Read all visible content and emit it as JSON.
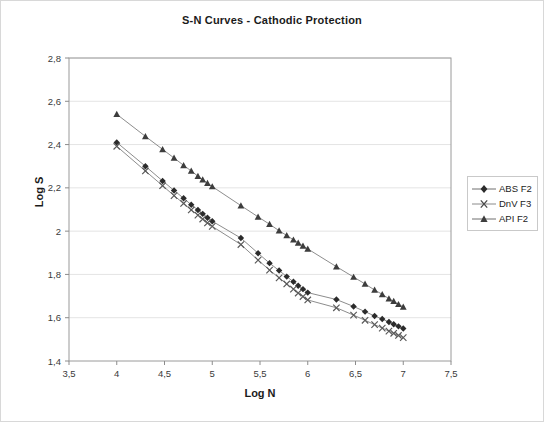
{
  "chart_data": {
    "type": "line",
    "title": "S-N Curves - Cathodic Protection",
    "xlabel": "Log N",
    "ylabel": "Log S",
    "xlim": [
      3.5,
      7.5
    ],
    "ylim": [
      1.4,
      2.8
    ],
    "xticks": [
      "3,5",
      "4",
      "4,5",
      "5",
      "5,5",
      "6",
      "6,5",
      "7",
      "7,5"
    ],
    "xtick_values": [
      3.5,
      4,
      4.5,
      5,
      5.5,
      6,
      6.5,
      7,
      7.5
    ],
    "yticks": [
      "1,4",
      "1,6",
      "1,8",
      "2",
      "2,2",
      "2,4",
      "2,6",
      "2,8"
    ],
    "ytick_values": [
      1.4,
      1.6,
      1.8,
      2.0,
      2.2,
      2.4,
      2.6,
      2.8
    ],
    "grid": "horizontal",
    "legend_position": "right",
    "decimal_separator": ",",
    "series": [
      {
        "name": "ABS F2",
        "marker": "diamond",
        "color": "#2b2b2b",
        "points": [
          [
            4.0,
            2.41
          ],
          [
            4.3,
            2.3
          ],
          [
            4.48,
            2.232
          ],
          [
            4.6,
            2.188
          ],
          [
            4.7,
            2.152
          ],
          [
            4.78,
            2.122
          ],
          [
            4.85,
            2.098
          ],
          [
            4.9,
            2.08
          ],
          [
            4.95,
            2.062
          ],
          [
            5.0,
            2.046
          ],
          [
            5.3,
            1.968
          ],
          [
            5.48,
            1.898
          ],
          [
            5.6,
            1.852
          ],
          [
            5.7,
            1.818
          ],
          [
            5.78,
            1.79
          ],
          [
            5.85,
            1.766
          ],
          [
            5.9,
            1.748
          ],
          [
            5.95,
            1.732
          ],
          [
            6.0,
            1.716
          ],
          [
            6.3,
            1.684
          ],
          [
            6.48,
            1.652
          ],
          [
            6.6,
            1.628
          ],
          [
            6.7,
            1.608
          ],
          [
            6.78,
            1.594
          ],
          [
            6.85,
            1.58
          ],
          [
            6.9,
            1.57
          ],
          [
            6.95,
            1.56
          ],
          [
            7.0,
            1.55
          ]
        ]
      },
      {
        "name": "DnV F3",
        "marker": "cross",
        "color": "#5a5a5a",
        "points": [
          [
            4.0,
            2.392
          ],
          [
            4.3,
            2.278
          ],
          [
            4.48,
            2.21
          ],
          [
            4.6,
            2.164
          ],
          [
            4.7,
            2.128
          ],
          [
            4.78,
            2.098
          ],
          [
            4.85,
            2.074
          ],
          [
            4.9,
            2.056
          ],
          [
            4.95,
            2.038
          ],
          [
            5.0,
            2.022
          ],
          [
            5.3,
            1.938
          ],
          [
            5.48,
            1.866
          ],
          [
            5.6,
            1.82
          ],
          [
            5.7,
            1.784
          ],
          [
            5.78,
            1.756
          ],
          [
            5.85,
            1.732
          ],
          [
            5.9,
            1.714
          ],
          [
            5.95,
            1.698
          ],
          [
            6.0,
            1.682
          ],
          [
            6.3,
            1.646
          ],
          [
            6.48,
            1.612
          ],
          [
            6.6,
            1.588
          ],
          [
            6.7,
            1.568
          ],
          [
            6.78,
            1.552
          ],
          [
            6.85,
            1.538
          ],
          [
            6.9,
            1.528
          ],
          [
            6.95,
            1.518
          ],
          [
            7.0,
            1.508
          ]
        ]
      },
      {
        "name": "API F2",
        "marker": "triangle",
        "color": "#3d3d3d",
        "points": [
          [
            4.0,
            2.54
          ],
          [
            4.3,
            2.438
          ],
          [
            4.48,
            2.378
          ],
          [
            4.6,
            2.338
          ],
          [
            4.7,
            2.304
          ],
          [
            4.78,
            2.278
          ],
          [
            4.85,
            2.254
          ],
          [
            4.9,
            2.238
          ],
          [
            4.95,
            2.222
          ],
          [
            5.0,
            2.206
          ],
          [
            5.3,
            2.118
          ],
          [
            5.48,
            2.066
          ],
          [
            5.6,
            2.032
          ],
          [
            5.7,
            2.002
          ],
          [
            5.78,
            1.98
          ],
          [
            5.85,
            1.96
          ],
          [
            5.9,
            1.946
          ],
          [
            5.95,
            1.932
          ],
          [
            6.0,
            1.918
          ],
          [
            6.3,
            1.836
          ],
          [
            6.48,
            1.788
          ],
          [
            6.6,
            1.756
          ],
          [
            6.7,
            1.728
          ],
          [
            6.78,
            1.708
          ],
          [
            6.85,
            1.688
          ],
          [
            6.9,
            1.676
          ],
          [
            6.95,
            1.662
          ],
          [
            7.0,
            1.65
          ]
        ]
      }
    ]
  },
  "legend": {
    "items": [
      {
        "label": "ABS F2"
      },
      {
        "label": "DnV F3"
      },
      {
        "label": "API F2"
      }
    ]
  }
}
